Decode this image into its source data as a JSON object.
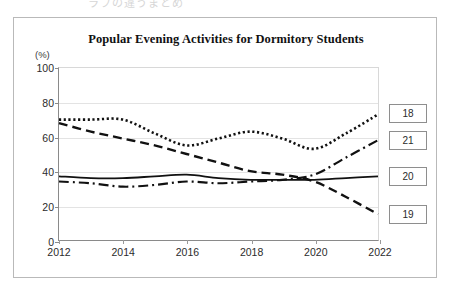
{
  "page": {
    "top_fragment": "ラフの違うまとめ"
  },
  "figure": {
    "title": "Popular Evening Activities for Dormitory Students",
    "y_axis_unit": "(%)"
  },
  "legend": {
    "items": [
      {
        "label": "18",
        "style": "dotted"
      },
      {
        "label": "19",
        "style": "dashed"
      },
      {
        "label": "20",
        "style": "solid"
      },
      {
        "label": "21",
        "style": "dash-dot"
      }
    ]
  },
  "chart_data": {
    "type": "line",
    "title": "Popular Evening Activities for Dormitory Students",
    "xlabel": "",
    "ylabel": "(%)",
    "ylim": [
      0,
      100
    ],
    "yticks": [
      0,
      20,
      40,
      60,
      80,
      100
    ],
    "xlim": [
      2012,
      2022
    ],
    "xticks": [
      2012,
      2014,
      2016,
      2018,
      2020,
      2022
    ],
    "xtick_labels": [
      "2012",
      "2014",
      "2016",
      "2018",
      "2020",
      "2022"
    ],
    "ytick_labels": [
      "0",
      "20",
      "40",
      "60",
      "80",
      "100"
    ],
    "grid": true,
    "legend_position": "right",
    "x": [
      2012,
      2013,
      2014,
      2015,
      2016,
      2017,
      2018,
      2019,
      2020,
      2021,
      2022
    ],
    "series": [
      {
        "name": "18",
        "line_style": "dotted",
        "color": "#111111",
        "values": [
          70,
          70,
          70,
          62,
          55,
          59,
          63,
          59,
          53,
          62,
          73
        ]
      },
      {
        "name": "19",
        "line_style": "dashed",
        "color": "#111111",
        "values": [
          68,
          63,
          59,
          55,
          50,
          45,
          40,
          38,
          34,
          25,
          15
        ]
      },
      {
        "name": "20",
        "line_style": "solid",
        "color": "#111111",
        "values": [
          37,
          36,
          36,
          37,
          38,
          36,
          35,
          35,
          35,
          36,
          37
        ]
      },
      {
        "name": "21",
        "line_style": "dash-dot",
        "color": "#111111",
        "values": [
          34,
          33,
          31,
          32,
          34,
          33,
          34,
          35,
          38,
          48,
          58
        ]
      }
    ]
  }
}
